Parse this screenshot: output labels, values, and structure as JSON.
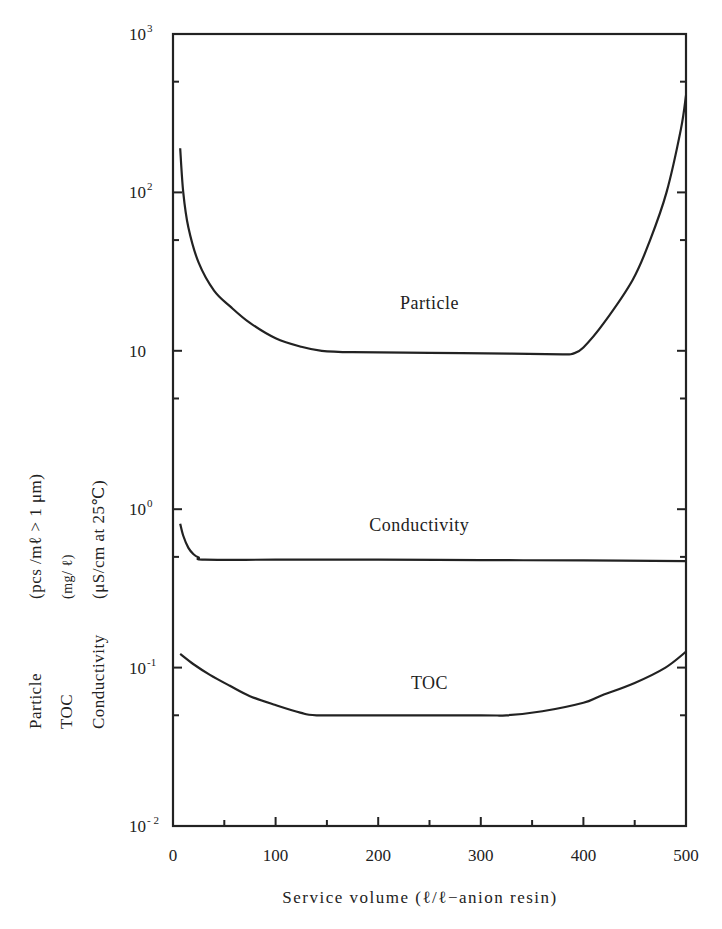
{
  "chart_data": {
    "type": "line",
    "title": "",
    "xlabel": "Service volume (ℓ/ℓ−anion resin)",
    "ylabel_lines": [
      {
        "name": "Particle",
        "unit": "(pcs /mℓ > 1 μm)"
      },
      {
        "name": "TOC",
        "unit": "(mg/ ℓ)"
      },
      {
        "name": "Conductivity",
        "unit": "(μS/cm at  25℃)"
      }
    ],
    "yscale": "log",
    "xlim": [
      0,
      500
    ],
    "ylim": [
      0.01,
      1000
    ],
    "grid": false,
    "x_ticks": [
      0,
      100,
      200,
      300,
      400,
      500
    ],
    "x_tick_labels": [
      "0",
      "100",
      "200",
      "300",
      "400",
      "500"
    ],
    "y_ticks": [
      {
        "value": 1000,
        "base": "10",
        "exp": "3"
      },
      {
        "value": 100,
        "base": "10",
        "exp": "2"
      },
      {
        "value": 10,
        "base": "10",
        "exp": ""
      },
      {
        "value": 1,
        "base": "10",
        "exp": "0"
      },
      {
        "value": 0.1,
        "base": "10",
        "exp": "-1"
      },
      {
        "value": 0.01,
        "base": "10",
        "exp": "- 2"
      }
    ],
    "y_minor_ticks": [
      500,
      50,
      5,
      0.5,
      0.05
    ],
    "series": [
      {
        "name": "Particle",
        "label": "Particle",
        "x": [
          7,
          10,
          15,
          25,
          40,
          56,
          75,
          100,
          125,
          145,
          175,
          250,
          330,
          380,
          390,
          400,
          420,
          448,
          465,
          481,
          495,
          500
        ],
        "y": [
          190,
          100,
          60,
          36,
          24,
          19,
          15,
          12,
          10.6,
          10,
          9.8,
          9.7,
          9.6,
          9.5,
          9.6,
          10.5,
          15,
          28,
          50,
          100,
          250,
          410
        ]
      },
      {
        "name": "Conductivity",
        "label": "Conductivity",
        "x": [
          7,
          10,
          15,
          20,
          25,
          31,
          100,
          200,
          300,
          400,
          500
        ],
        "y": [
          0.81,
          0.68,
          0.57,
          0.52,
          0.495,
          0.48,
          0.48,
          0.48,
          0.477,
          0.475,
          0.47
        ]
      },
      {
        "name": "TOC",
        "label": "TOC",
        "x": [
          7,
          20,
          36,
          55,
          75,
          100,
          124,
          140,
          200,
          300,
          325,
          360,
          400,
          416,
          450,
          480,
          500
        ],
        "y": [
          0.122,
          0.105,
          0.09,
          0.077,
          0.066,
          0.058,
          0.052,
          0.05,
          0.05,
          0.05,
          0.05,
          0.053,
          0.06,
          0.066,
          0.08,
          0.1,
          0.126
        ]
      }
    ],
    "annotations": [
      {
        "text": "Particle",
        "x": 250,
        "y": 20
      },
      {
        "text": "Conductivity",
        "x": 240,
        "y": 0.8
      },
      {
        "text": "TOC",
        "x": 250,
        "y": 0.08
      }
    ]
  }
}
